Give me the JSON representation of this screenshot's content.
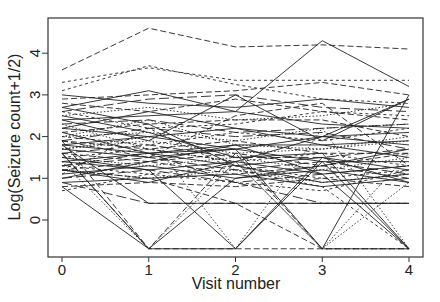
{
  "chart_data": {
    "type": "line",
    "title": "",
    "xlabel": "Visit number",
    "ylabel": "Log(Seizure count+1/2)",
    "x": [
      0,
      1,
      2,
      3,
      4
    ],
    "x_ticks": [
      "0",
      "1",
      "2",
      "3",
      "4"
    ],
    "y_ticks": [
      "0",
      "1",
      "2",
      "3",
      "4"
    ],
    "xlim": [
      -0.15,
      4.15
    ],
    "ylim": [
      -0.85,
      4.85
    ],
    "grid": false,
    "legend": "none",
    "line_color": "#222222",
    "series": [
      {
        "name": "s1",
        "values": [
          3.6,
          4.6,
          4.15,
          4.2,
          4.1
        ],
        "dash": "dashed"
      },
      {
        "name": "s2",
        "values": [
          3.3,
          3.65,
          3.35,
          3.35,
          3.35
        ],
        "dash": "dotted-dash"
      },
      {
        "name": "s3",
        "values": [
          3.1,
          3.7,
          3.25,
          2.9,
          2.8
        ],
        "dash": "dotted-dash"
      },
      {
        "name": "s4",
        "values": [
          2.9,
          3.0,
          3.1,
          3.3,
          3.0
        ],
        "dash": "dashed"
      },
      {
        "name": "s5",
        "values": [
          2.7,
          3.1,
          2.6,
          4.3,
          3.2
        ],
        "dash": "solid"
      },
      {
        "name": "s6",
        "values": [
          3.0,
          2.8,
          2.7,
          2.9,
          2.7
        ],
        "dash": "solid"
      },
      {
        "name": "s7",
        "values": [
          2.6,
          2.9,
          3.0,
          2.7,
          2.6
        ],
        "dash": "longdash"
      },
      {
        "name": "s8",
        "values": [
          2.8,
          2.6,
          2.9,
          2.6,
          2.4
        ],
        "dash": "dashed"
      },
      {
        "name": "s9",
        "values": [
          2.5,
          2.7,
          2.4,
          2.5,
          2.8
        ],
        "dash": "dotted"
      },
      {
        "name": "s10",
        "values": [
          2.4,
          2.5,
          2.6,
          2.3,
          2.2
        ],
        "dash": "solid"
      },
      {
        "name": "s11",
        "values": [
          2.6,
          2.2,
          2.3,
          2.6,
          2.5
        ],
        "dash": "dotted-dash"
      },
      {
        "name": "s12",
        "values": [
          2.3,
          2.4,
          2.1,
          2.2,
          2.3
        ],
        "dash": "longdash"
      },
      {
        "name": "s13",
        "values": [
          2.2,
          2.6,
          2.2,
          2.0,
          2.1
        ],
        "dash": "solid"
      },
      {
        "name": "s14",
        "values": [
          2.1,
          2.3,
          2.4,
          2.4,
          2.0
        ],
        "dash": "dashed"
      },
      {
        "name": "s15",
        "values": [
          2.0,
          2.1,
          1.9,
          2.2,
          2.3
        ],
        "dash": "dotted"
      },
      {
        "name": "s16",
        "values": [
          2.2,
          2.0,
          2.2,
          1.8,
          1.9
        ],
        "dash": "solid"
      },
      {
        "name": "s17",
        "values": [
          1.9,
          2.2,
          2.0,
          2.1,
          1.7
        ],
        "dash": "longdash"
      },
      {
        "name": "s18",
        "values": [
          2.0,
          1.8,
          2.1,
          1.9,
          2.2
        ],
        "dash": "dotted-dash"
      },
      {
        "name": "s19",
        "values": [
          1.8,
          2.0,
          1.7,
          2.0,
          1.8
        ],
        "dash": "solid"
      },
      {
        "name": "s20",
        "values": [
          1.9,
          1.7,
          1.9,
          1.6,
          1.6
        ],
        "dash": "dashed"
      },
      {
        "name": "s21",
        "values": [
          1.7,
          1.9,
          1.6,
          1.7,
          2.0
        ],
        "dash": "dotted"
      },
      {
        "name": "s22",
        "values": [
          1.8,
          1.6,
          1.8,
          1.8,
          1.5
        ],
        "dash": "solid"
      },
      {
        "name": "s23",
        "values": [
          1.6,
          1.8,
          1.5,
          1.5,
          1.7
        ],
        "dash": "longdash"
      },
      {
        "name": "s24",
        "values": [
          1.7,
          1.5,
          1.7,
          1.4,
          1.4
        ],
        "dash": "solid"
      },
      {
        "name": "s25",
        "values": [
          1.5,
          1.7,
          1.4,
          1.6,
          1.3
        ],
        "dash": "dotted-dash"
      },
      {
        "name": "s26",
        "values": [
          1.6,
          1.4,
          1.6,
          1.3,
          1.6
        ],
        "dash": "dashed"
      },
      {
        "name": "s27",
        "values": [
          1.4,
          1.6,
          1.3,
          1.5,
          1.2
        ],
        "dash": "solid"
      },
      {
        "name": "s28",
        "values": [
          1.5,
          1.3,
          1.5,
          1.2,
          1.5
        ],
        "dash": "dotted"
      },
      {
        "name": "s29",
        "values": [
          1.3,
          1.5,
          1.2,
          1.4,
          1.1
        ],
        "dash": "longdash"
      },
      {
        "name": "s30",
        "values": [
          1.4,
          1.2,
          1.4,
          1.1,
          1.3
        ],
        "dash": "solid"
      },
      {
        "name": "s31",
        "values": [
          1.2,
          1.4,
          1.1,
          1.3,
          1.0
        ],
        "dash": "dashed"
      },
      {
        "name": "s32",
        "values": [
          1.3,
          1.1,
          1.3,
          1.0,
          1.2
        ],
        "dash": "dotted-dash"
      },
      {
        "name": "s33",
        "values": [
          1.1,
          1.3,
          1.0,
          1.2,
          0.9
        ],
        "dash": "solid"
      },
      {
        "name": "s34",
        "values": [
          1.2,
          1.0,
          1.2,
          0.9,
          1.1
        ],
        "dash": "dotted"
      },
      {
        "name": "s35",
        "values": [
          1.0,
          1.2,
          0.9,
          1.1,
          1.3
        ],
        "dash": "longdash"
      },
      {
        "name": "s36",
        "values": [
          0.9,
          1.0,
          1.1,
          0.8,
          1.0
        ],
        "dash": "solid"
      },
      {
        "name": "s37",
        "values": [
          0.8,
          0.9,
          0.8,
          1.0,
          0.8
        ],
        "dash": "dashed"
      },
      {
        "name": "s38",
        "values": [
          0.7,
          1.1,
          0.9,
          0.7,
          1.2
        ],
        "dash": "dotted-dash"
      },
      {
        "name": "s39",
        "values": [
          1.8,
          0.4,
          0.4,
          0.4,
          0.4
        ],
        "dash": "solid"
      },
      {
        "name": "s40",
        "values": [
          1.6,
          -0.69,
          -0.69,
          1.5,
          0.9
        ],
        "dash": "solid"
      },
      {
        "name": "s41",
        "values": [
          1.9,
          -0.69,
          1.6,
          -0.69,
          -0.69
        ],
        "dash": "dashed"
      },
      {
        "name": "s42",
        "values": [
          1.5,
          1.2,
          -0.69,
          1.4,
          -0.69
        ],
        "dash": "solid"
      },
      {
        "name": "s43",
        "values": [
          1.7,
          2.0,
          -0.69,
          2.2,
          -0.69
        ],
        "dash": "dotted"
      },
      {
        "name": "s44",
        "values": [
          2.1,
          1.6,
          1.7,
          -0.69,
          3.0
        ],
        "dash": "solid"
      },
      {
        "name": "s45",
        "values": [
          1.4,
          -0.69,
          1.4,
          -0.69,
          0.9
        ],
        "dash": "dotted"
      },
      {
        "name": "s46",
        "values": [
          1.2,
          1.0,
          0.4,
          -0.69,
          -0.69
        ],
        "dash": "dashed"
      },
      {
        "name": "s47",
        "values": [
          1.3,
          1.6,
          0.9,
          0.4,
          0.4
        ],
        "dash": "longdash"
      },
      {
        "name": "s48",
        "values": [
          0.9,
          0.4,
          0.4,
          0.4,
          0.4
        ],
        "dash": "longdash"
      },
      {
        "name": "s49",
        "values": [
          1.0,
          1.4,
          1.8,
          1.1,
          -0.69
        ],
        "dash": "solid"
      },
      {
        "name": "s50",
        "values": [
          2.3,
          1.7,
          1.4,
          -0.69,
          1.6
        ],
        "dash": "dotted"
      },
      {
        "name": "s51",
        "values": [
          1.1,
          2.2,
          1.2,
          0.8,
          -0.69
        ],
        "dash": "dotted-dash"
      },
      {
        "name": "s52",
        "values": [
          2.4,
          1.9,
          3.0,
          1.9,
          2.9
        ],
        "dash": "solid"
      },
      {
        "name": "s53",
        "values": [
          2.7,
          2.3,
          1.3,
          0.9,
          1.1
        ],
        "dash": "solid"
      },
      {
        "name": "s54",
        "values": [
          0.8,
          -0.69,
          1.0,
          1.3,
          1.7
        ],
        "dash": "solid"
      },
      {
        "name": "s55",
        "values": [
          1.6,
          -0.69,
          -0.69,
          -0.69,
          -0.69
        ],
        "dash": "dashed"
      },
      {
        "name": "s56",
        "values": [
          2.5,
          2.1,
          1.5,
          1.6,
          -0.69
        ],
        "dash": "solid"
      },
      {
        "name": "s57",
        "values": [
          1.2,
          0.9,
          1.4,
          2.0,
          2.9
        ],
        "dash": "solid"
      },
      {
        "name": "s58",
        "values": [
          1.9,
          1.5,
          2.5,
          2.8,
          1.3
        ],
        "dash": "dashed"
      },
      {
        "name": "s59",
        "values": [
          2.0,
          2.4,
          1.8,
          1.7,
          1.9
        ],
        "dash": "dotted"
      }
    ]
  }
}
